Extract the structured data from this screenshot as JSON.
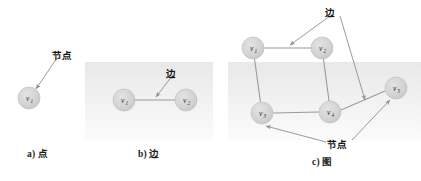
{
  "figure": {
    "width": 421,
    "height": 181,
    "background": "#ffffff",
    "node_fill": "#d4d4d4",
    "node_stroke": "#bdbdbd",
    "edge_color": "#9a9a9a",
    "arrow_color": "#8e8e8e",
    "text_color": "#1c1c1c"
  },
  "panels": [
    {
      "id": "a",
      "caption": "a) 点",
      "caption_x": 27,
      "caption_y": 147,
      "annotations": [
        {
          "id": "a-node-label",
          "text": "节点",
          "x": 52,
          "y": 48
        }
      ],
      "nodes": [
        {
          "id": "v1",
          "label": "v",
          "sub": "1",
          "cx": 29,
          "cy": 98,
          "r": 11
        }
      ],
      "edges": [],
      "pointers": [
        {
          "from": [
            57,
            58
          ],
          "to": [
            36,
            89
          ]
        }
      ]
    },
    {
      "id": "b",
      "caption": "b) 边",
      "caption_x": 138,
      "caption_y": 147,
      "annotations": [
        {
          "id": "b-edge-label",
          "text": "边",
          "x": 166,
          "y": 66
        }
      ],
      "nodes": [
        {
          "id": "v1",
          "label": "v",
          "sub": "1",
          "cx": 124,
          "cy": 100,
          "r": 11
        },
        {
          "id": "v2",
          "label": "v",
          "sub": "2",
          "cx": 186,
          "cy": 100,
          "r": 11
        }
      ],
      "edges": [
        {
          "from": "v1",
          "to": "v2"
        }
      ],
      "pointers": [
        {
          "from": [
            172,
            76
          ],
          "to": [
            155,
            98
          ]
        }
      ]
    },
    {
      "id": "c",
      "caption": "c) 图",
      "caption_x": 312,
      "caption_y": 155,
      "annotations": [
        {
          "id": "c-edge-label",
          "text": "边",
          "x": 325,
          "y": 6
        },
        {
          "id": "c-node-label",
          "text": "节点",
          "x": 327,
          "y": 138
        }
      ],
      "nodes": [
        {
          "id": "v1",
          "label": "v",
          "sub": "1",
          "cx": 253,
          "cy": 48,
          "r": 11
        },
        {
          "id": "v2",
          "label": "v",
          "sub": "2",
          "cx": 322,
          "cy": 48,
          "r": 11
        },
        {
          "id": "v3",
          "label": "v",
          "sub": "3",
          "cx": 262,
          "cy": 113,
          "r": 11
        },
        {
          "id": "v4",
          "label": "v",
          "sub": "4",
          "cx": 330,
          "cy": 112,
          "r": 11
        },
        {
          "id": "v5",
          "label": "v",
          "sub": "5",
          "cx": 396,
          "cy": 88,
          "r": 11
        }
      ],
      "edges": [
        {
          "from": "v1",
          "to": "v2"
        },
        {
          "from": "v1",
          "to": "v3"
        },
        {
          "from": "v2",
          "to": "v4"
        },
        {
          "from": "v3",
          "to": "v4"
        },
        {
          "from": "v4",
          "to": "v5"
        }
      ],
      "pointers": [
        {
          "from": [
            330,
            16
          ],
          "to": [
            289,
            44
          ]
        },
        {
          "from": [
            340,
            16
          ],
          "to": [
            366,
            101
          ]
        },
        {
          "from": [
            326,
            142
          ],
          "to": [
            265,
            126
          ]
        },
        {
          "from": [
            352,
            140
          ],
          "to": [
            390,
            101
          ]
        }
      ]
    }
  ],
  "shading_bands": [
    {
      "x": 85,
      "y": 62,
      "w": 128,
      "h": 78,
      "color": "#ededed"
    },
    {
      "x": 228,
      "y": 62,
      "w": 193,
      "h": 78,
      "color": "#ededed"
    }
  ]
}
